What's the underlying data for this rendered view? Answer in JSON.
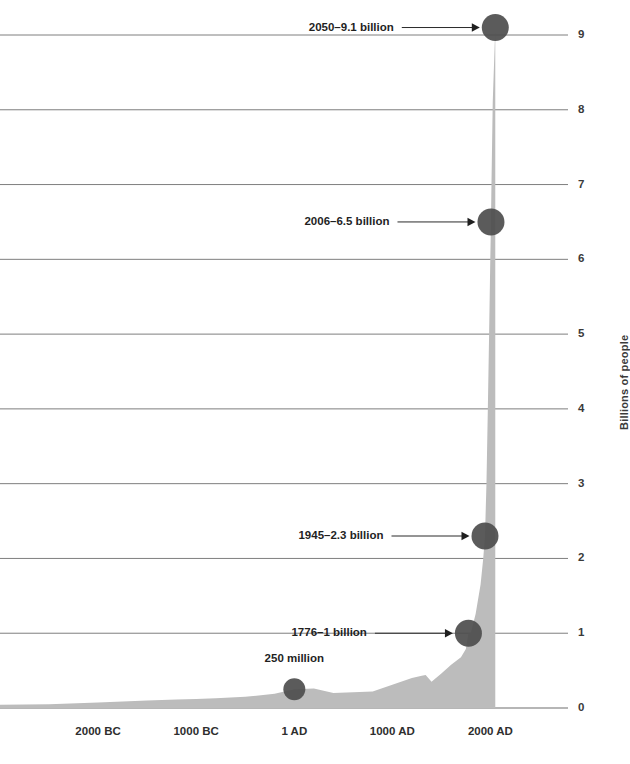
{
  "chart_data": {
    "type": "area",
    "title": "",
    "subtitle": "",
    "xlabel": "",
    "ylabel": "Billions of people",
    "ylim": [
      0,
      9.4
    ],
    "xlim": [
      -3000,
      2200
    ],
    "grid": true,
    "legend": "none",
    "x_tick_labels": [
      "2000 BC",
      "1000 BC",
      "1 AD",
      "1000 AD",
      "2000 AD"
    ],
    "x_tick_values": [
      -2000,
      -1000,
      1,
      1000,
      2000
    ],
    "y_tick_labels": [
      "0",
      "1",
      "2",
      "3",
      "4",
      "5",
      "6",
      "7",
      "8",
      "9"
    ],
    "y_tick_values": [
      0,
      1,
      2,
      3,
      4,
      5,
      6,
      7,
      8,
      9
    ],
    "series": [
      {
        "name": "World population",
        "x": [
          -3000,
          -2500,
          -2000,
          -1500,
          -1200,
          -1000,
          -800,
          -500,
          -200,
          1,
          200,
          400,
          600,
          800,
          1000,
          1200,
          1300,
          1340,
          1400,
          1500,
          1600,
          1700,
          1750,
          1776,
          1800,
          1850,
          1900,
          1927,
          1945,
          1960,
          1974,
          1987,
          1999,
          2006,
          2011,
          2024,
          2050
        ],
        "y": [
          0.045,
          0.05,
          0.072,
          0.1,
          0.115,
          0.12,
          0.13,
          0.15,
          0.19,
          0.25,
          0.26,
          0.2,
          0.21,
          0.22,
          0.31,
          0.4,
          0.43,
          0.44,
          0.35,
          0.46,
          0.58,
          0.68,
          0.79,
          1.0,
          1.0,
          1.26,
          1.65,
          2.0,
          2.3,
          3.0,
          4.0,
          5.0,
          6.0,
          6.5,
          7.0,
          8.1,
          9.1
        ]
      }
    ],
    "annotations": [
      {
        "label": "2050–9.1 billion",
        "year": 2050,
        "value": 9.1,
        "has_arrow": true
      },
      {
        "label": "2006–6.5 billion",
        "year": 2006,
        "value": 6.5,
        "has_arrow": true
      },
      {
        "label": "1945–2.3 billion",
        "year": 1945,
        "value": 2.3,
        "has_arrow": true
      },
      {
        "label": "1776–1 billion",
        "year": 1776,
        "value": 1.0,
        "has_arrow": true
      },
      {
        "label": "250 million",
        "year": 1,
        "value": 0.25,
        "has_arrow": false
      }
    ],
    "colors": {
      "area_fill": "#bcbcbc",
      "marker": "#4d4d4d",
      "grid": "#6f6f6f",
      "text": "#1f1f1f",
      "background": "#ffffff"
    }
  }
}
